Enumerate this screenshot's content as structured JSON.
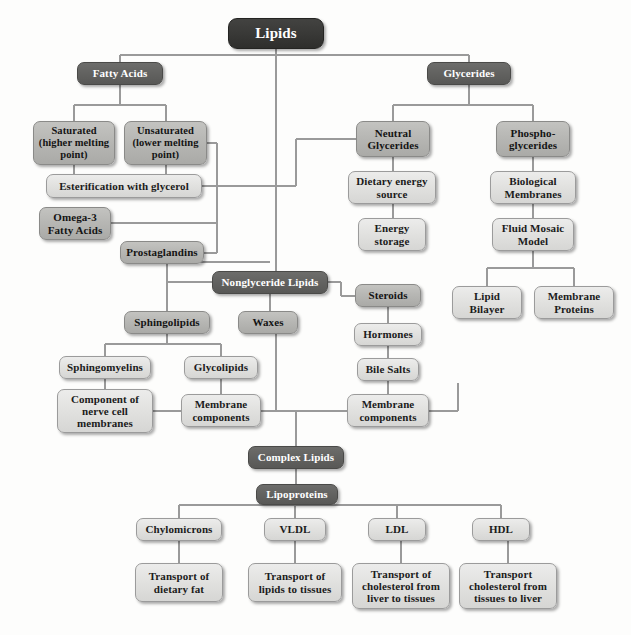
{
  "diagram": {
    "colors": {
      "root_fill": "#3a3a38",
      "dark_fill": "#636361",
      "mid_fill": "#b7b7b4",
      "light_fill": "#e2e2e0",
      "line": "#9a9a9a",
      "page_background": "#fdfdfc"
    },
    "nodes": [
      {
        "id": "lipids",
        "label": "Lipids",
        "tone": "black",
        "x": 228,
        "y": 18,
        "w": 96,
        "h": 31,
        "font": 15
      },
      {
        "id": "fatty_acids",
        "label": "Fatty Acids",
        "tone": "dark",
        "x": 77,
        "y": 62,
        "w": 86,
        "h": 23,
        "font": 11
      },
      {
        "id": "saturated",
        "label": "Saturated (higher melting point)",
        "tone": "mid",
        "x": 33,
        "y": 121,
        "w": 82,
        "h": 44,
        "font": 10.5
      },
      {
        "id": "unsaturated",
        "label": "Unsaturated (lower melting point)",
        "tone": "mid",
        "x": 124,
        "y": 121,
        "w": 83,
        "h": 44,
        "font": 10.5
      },
      {
        "id": "esterification",
        "label": "Esterification with glycerol",
        "tone": "light",
        "x": 46,
        "y": 174,
        "w": 156,
        "h": 24,
        "font": 11
      },
      {
        "id": "omega3",
        "label": "Omega-3 Fatty Acids",
        "tone": "mid",
        "x": 39,
        "y": 207,
        "w": 72,
        "h": 33,
        "font": 11
      },
      {
        "id": "prostaglandins",
        "label": "Prostaglandins",
        "tone": "mid",
        "x": 120,
        "y": 241,
        "w": 84,
        "h": 23,
        "font": 11
      },
      {
        "id": "glycerides",
        "label": "Glycerides",
        "tone": "dark",
        "x": 427,
        "y": 62,
        "w": 84,
        "h": 23,
        "font": 11
      },
      {
        "id": "neutral_glycerides",
        "label": "Neutral Glycerides",
        "tone": "mid",
        "x": 356,
        "y": 121,
        "w": 74,
        "h": 36,
        "font": 11
      },
      {
        "id": "phosphoglycerides",
        "label": "Phospho- glycerides",
        "tone": "mid",
        "x": 496,
        "y": 121,
        "w": 74,
        "h": 36,
        "font": 11
      },
      {
        "id": "dietary_energy_source",
        "label": "Dietary energy source",
        "tone": "light",
        "x": 348,
        "y": 171,
        "w": 88,
        "h": 33,
        "font": 11
      },
      {
        "id": "energy_storage",
        "label": "Energy storage",
        "tone": "light",
        "x": 358,
        "y": 218,
        "w": 68,
        "h": 33,
        "font": 11
      },
      {
        "id": "biological_membranes",
        "label": "Biological Membranes",
        "tone": "light",
        "x": 490,
        "y": 171,
        "w": 86,
        "h": 33,
        "font": 11
      },
      {
        "id": "fluid_mosaic_model",
        "label": "Fluid Mosaic Model",
        "tone": "light",
        "x": 492,
        "y": 218,
        "w": 82,
        "h": 33,
        "font": 11
      },
      {
        "id": "lipid_bilayer",
        "label": "Lipid Bilayer",
        "tone": "light",
        "x": 452,
        "y": 286,
        "w": 70,
        "h": 33,
        "font": 11
      },
      {
        "id": "membrane_proteins",
        "label": "Membrane Proteins",
        "tone": "light",
        "x": 534,
        "y": 286,
        "w": 80,
        "h": 33,
        "font": 11
      },
      {
        "id": "nonglyceride_lipids",
        "label": "Nonglyceride Lipids",
        "tone": "dark",
        "x": 212,
        "y": 271,
        "w": 116,
        "h": 23,
        "font": 11
      },
      {
        "id": "waxes",
        "label": "Waxes",
        "tone": "mid",
        "x": 238,
        "y": 311,
        "w": 60,
        "h": 23,
        "font": 11
      },
      {
        "id": "sphingolipids",
        "label": "Sphingolipids",
        "tone": "mid",
        "x": 124,
        "y": 311,
        "w": 86,
        "h": 23,
        "font": 11
      },
      {
        "id": "sphingomyelins",
        "label": "Sphingomyelins",
        "tone": "light",
        "x": 59,
        "y": 356,
        "w": 92,
        "h": 23,
        "font": 11
      },
      {
        "id": "glycolipids",
        "label": "Glycolipids",
        "tone": "light",
        "x": 184,
        "y": 356,
        "w": 74,
        "h": 23,
        "font": 11
      },
      {
        "id": "nerve_cell_membranes",
        "label": "Component of nerve cell membranes",
        "tone": "light",
        "x": 57,
        "y": 389,
        "w": 96,
        "h": 44,
        "font": 11
      },
      {
        "id": "membrane_components_1",
        "label": "Membrane components",
        "tone": "light",
        "x": 181,
        "y": 394,
        "w": 80,
        "h": 33,
        "font": 11
      },
      {
        "id": "steroids",
        "label": "Steroids",
        "tone": "mid",
        "x": 355,
        "y": 284,
        "w": 66,
        "h": 23,
        "font": 11
      },
      {
        "id": "hormones",
        "label": "Hormones",
        "tone": "light",
        "x": 354,
        "y": 323,
        "w": 68,
        "h": 23,
        "font": 11
      },
      {
        "id": "bile_salts",
        "label": "Bile Salts",
        "tone": "light",
        "x": 357,
        "y": 358,
        "w": 62,
        "h": 23,
        "font": 11
      },
      {
        "id": "membrane_components_2",
        "label": "Membrane components",
        "tone": "light",
        "x": 347,
        "y": 394,
        "w": 82,
        "h": 33,
        "font": 11
      },
      {
        "id": "complex_lipids",
        "label": "Complex Lipids",
        "tone": "dark",
        "x": 248,
        "y": 446,
        "w": 96,
        "h": 23,
        "font": 11
      },
      {
        "id": "lipoproteins",
        "label": "Lipoproteins",
        "tone": "dark",
        "x": 256,
        "y": 484,
        "w": 82,
        "h": 21,
        "font": 11
      },
      {
        "id": "chylomicrons",
        "label": "Chylomicrons",
        "tone": "light",
        "x": 136,
        "y": 518,
        "w": 86,
        "h": 23,
        "font": 11
      },
      {
        "id": "vldl",
        "label": "VLDL",
        "tone": "light",
        "x": 264,
        "y": 518,
        "w": 62,
        "h": 23,
        "font": 11
      },
      {
        "id": "ldl",
        "label": "LDL",
        "tone": "light",
        "x": 368,
        "y": 518,
        "w": 58,
        "h": 23,
        "font": 11
      },
      {
        "id": "hdl",
        "label": "HDL",
        "tone": "light",
        "x": 472,
        "y": 518,
        "w": 58,
        "h": 23,
        "font": 11
      },
      {
        "id": "transport_dietary_fat",
        "label": "Transport of dietary fat",
        "tone": "light",
        "x": 135,
        "y": 563,
        "w": 88,
        "h": 39,
        "font": 11
      },
      {
        "id": "transport_lipids",
        "label": "Transport of lipids to tissues",
        "tone": "light",
        "x": 248,
        "y": 563,
        "w": 94,
        "h": 39,
        "font": 11
      },
      {
        "id": "transport_chol_liver",
        "label": "Transport of cholesterol from liver to tissues",
        "tone": "light",
        "x": 352,
        "y": 563,
        "w": 98,
        "h": 46,
        "font": 11
      },
      {
        "id": "transport_chol_tissues",
        "label": "Transport cholesterol from tissues to liver",
        "tone": "light",
        "x": 459,
        "y": 563,
        "w": 98,
        "h": 46,
        "font": 11
      }
    ]
  }
}
